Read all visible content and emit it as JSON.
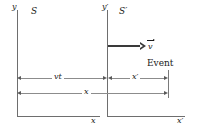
{
  "figure": {
    "frames": {
      "s_label": "S",
      "s_prime_label": "S′"
    },
    "axes": {
      "y_label": "y",
      "y_prime_label": "y′",
      "x_label": "x",
      "x_prime_label": "x′"
    },
    "velocity": {
      "symbol": "v",
      "arrow_name": "velocity-vector-arrow"
    },
    "event": {
      "label": "Event"
    },
    "dimensions": [
      {
        "name": "vt",
        "label": "vt"
      },
      {
        "name": "x-prime",
        "label": "x′"
      },
      {
        "name": "x",
        "label": "x"
      }
    ],
    "colors": {
      "axis": "#6e6e6e",
      "dimension": "#8c8c8c",
      "arrow": "#3a3a3a",
      "text": "#1a1a1a",
      "background": "#ffffff"
    }
  }
}
